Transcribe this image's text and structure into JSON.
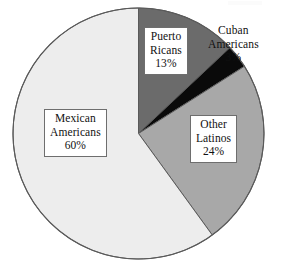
{
  "chart_data": {
    "type": "pie",
    "title": "",
    "subtitle": "",
    "xlabel": "",
    "ylabel": "",
    "legend_position": "none",
    "grid": false,
    "start_angle_oclock": 12,
    "direction": "clockwise",
    "categories": [
      "Puerto Ricans",
      "Cuban Americans",
      "Other Latinos",
      "Mexican Americans"
    ],
    "values": [
      13,
      3,
      24,
      60
    ],
    "value_unit": "%",
    "colors": [
      "#6b6b6b",
      "#0a0a0a",
      "#a8a8a8",
      "#ededed"
    ],
    "outline_color": "#5a5a5a",
    "slices": [
      {
        "name": "Puerto Ricans",
        "value": 13,
        "value_label": "13%",
        "color": "#6b6b6b",
        "label_lines": [
          "Puerto",
          "Ricans",
          "13%"
        ],
        "label_boxed": true
      },
      {
        "name": "Cuban Americans",
        "value": 3,
        "value_label": "3%",
        "color": "#0a0a0a",
        "label_lines": [
          "Cuban",
          "Americans",
          "3%"
        ],
        "label_boxed": false
      },
      {
        "name": "Other Latinos",
        "value": 24,
        "value_label": "24%",
        "color": "#a8a8a8",
        "label_lines": [
          "Other",
          "Latinos",
          "24%"
        ],
        "label_boxed": true
      },
      {
        "name": "Mexican Americans",
        "value": 60,
        "value_label": "60%",
        "color": "#ededed",
        "label_lines": [
          "Mexican",
          "Americans",
          "60%"
        ],
        "label_boxed": true
      }
    ]
  },
  "labels": {
    "puerto_ricans": {
      "line1": "Puerto",
      "line2": "Ricans",
      "line3": "13%"
    },
    "cuban_americans": {
      "line1": "Cuban",
      "line2": "Americans",
      "line3": "3%"
    },
    "other_latinos": {
      "line1": "Other",
      "line2": "Latinos",
      "line3": "24%"
    },
    "mexican_americans": {
      "line1": "Mexican",
      "line2": "Americans",
      "line3": "60%"
    }
  }
}
